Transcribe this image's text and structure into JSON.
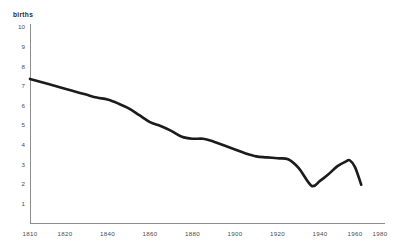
{
  "chart_data": {
    "type": "line",
    "title": "",
    "subtitle": "",
    "xlabel": "",
    "ylabel": "births",
    "ylim": [
      0,
      10
    ],
    "xlim": [
      1810,
      1980
    ],
    "grid": false,
    "legend": null,
    "y_ticks": [
      10,
      9,
      8,
      7,
      6,
      5,
      4,
      3,
      2,
      1
    ],
    "x_ticks": [
      1810,
      1820,
      1840,
      1860,
      1880,
      1900,
      1920,
      1940,
      1960,
      1980
    ],
    "series": [
      {
        "name": "births",
        "x": [
          1810,
          1815,
          1820,
          1825,
          1830,
          1835,
          1840,
          1845,
          1850,
          1855,
          1860,
          1865,
          1870,
          1875,
          1880,
          1885,
          1890,
          1895,
          1900,
          1905,
          1910,
          1915,
          1920,
          1925,
          1930,
          1936,
          1940,
          1945,
          1950,
          1955,
          1957,
          1960,
          1965
        ],
        "values": [
          7.35,
          7.1,
          6.85,
          6.7,
          6.55,
          6.4,
          6.3,
          6.1,
          5.85,
          5.5,
          5.15,
          4.95,
          4.7,
          4.4,
          4.3,
          4.3,
          4.15,
          3.95,
          3.75,
          3.55,
          3.4,
          3.35,
          3.3,
          3.25,
          2.8,
          1.9,
          2.15,
          2.5,
          2.9,
          3.15,
          3.2,
          2.85,
          1.95
        ]
      }
    ]
  },
  "axis": {
    "y_title": "births"
  }
}
